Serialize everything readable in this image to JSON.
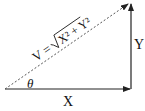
{
  "diagram": {
    "type": "vector-decomposition",
    "labels": {
      "horizontal": "X",
      "vertical": "Y",
      "angle": "θ",
      "resultant_prefix": "V = ",
      "resultant_formula": "√X² + Y²",
      "resultant_lhs": "V =",
      "resultant_radicand": "X² + Y²"
    },
    "colors": {
      "line": "#222222",
      "dashed": "#555555",
      "background": "#ffffff"
    }
  }
}
